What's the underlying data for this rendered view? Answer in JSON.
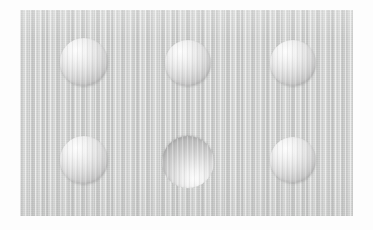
{
  "image": {
    "title": "Specimen Surface Micrograph",
    "kind": "grayscale-surface-image",
    "width": 373,
    "height": 230,
    "background_color": "#fdfdfd"
  },
  "plate": {
    "label": "specimen-plate",
    "base_color": "#d3d4d3",
    "texture": "fine vertical striations",
    "x": 20,
    "y": 10,
    "width": 333,
    "height": 206
  },
  "features": {
    "count": 6,
    "arrangement": "2 rows x 3 columns",
    "items": [
      {
        "id": "feature-r1c1",
        "row": 1,
        "column": 1,
        "shape": "circle",
        "relief": "convex",
        "highlight": "upper-left",
        "cx": 84,
        "cy": 62,
        "r": 24,
        "highlight_color": "#fdfdfd",
        "shadow_color": "#adadad"
      },
      {
        "id": "feature-r1c2",
        "row": 1,
        "column": 2,
        "shape": "circle",
        "relief": "convex",
        "highlight": "upper-left",
        "cx": 188,
        "cy": 63,
        "r": 23,
        "highlight_color": "#fdfdfd",
        "shadow_color": "#adadad"
      },
      {
        "id": "feature-r1c3",
        "row": 1,
        "column": 3,
        "shape": "circle",
        "relief": "convex",
        "highlight": "upper-left",
        "cx": 293,
        "cy": 63,
        "r": 23,
        "highlight_color": "#fdfdfd",
        "shadow_color": "#adadad"
      },
      {
        "id": "feature-r2c1",
        "row": 2,
        "column": 1,
        "shape": "circle",
        "relief": "convex",
        "highlight": "upper-left",
        "cx": 84,
        "cy": 160,
        "r": 24,
        "highlight_color": "#fdfdfd",
        "shadow_color": "#adadad"
      },
      {
        "id": "feature-r2c2",
        "row": 2,
        "column": 2,
        "shape": "circle",
        "relief": "concave",
        "highlight": "lower-left",
        "cx": 188,
        "cy": 162,
        "r": 26,
        "highlight_color": "#fcfcfc",
        "shadow_color": "#b0b0b0"
      },
      {
        "id": "feature-r2c3",
        "row": 2,
        "column": 3,
        "shape": "circle",
        "relief": "convex",
        "highlight": "upper-left",
        "cx": 293,
        "cy": 160,
        "r": 23,
        "highlight_color": "#fdfdfd",
        "shadow_color": "#adadad"
      }
    ]
  }
}
